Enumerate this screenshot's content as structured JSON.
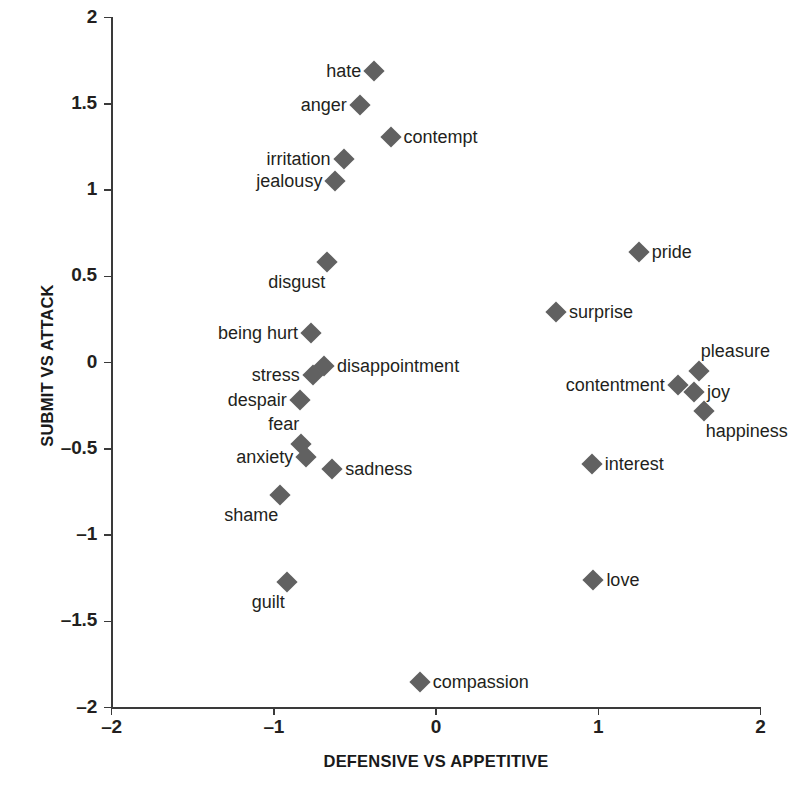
{
  "chart_data": {
    "type": "scatter",
    "title": "",
    "xlabel": "DEFENSIVE VS APPETITIVE",
    "ylabel": "SUBMIT VS ATTACK",
    "xlim": [
      -2,
      2
    ],
    "ylim": [
      -2,
      2
    ],
    "xticks": [
      "-2",
      "-1",
      "0",
      "1",
      "2"
    ],
    "xtick_values": [
      -2,
      -1,
      0,
      1,
      2
    ],
    "yticks": [
      "2",
      "1.5",
      "1",
      "0.5",
      "0",
      "-0.5",
      "-1",
      "-1.5",
      "-2"
    ],
    "ytick_values": [
      2,
      1.5,
      1,
      0.5,
      0,
      -0.5,
      -1,
      -1.5,
      -2
    ],
    "grid": false,
    "legend": null,
    "marker": "diamond",
    "marker_color": "#616161",
    "axis_color": "#3a3a3a",
    "points": [
      {
        "label": "hate",
        "x": -0.38,
        "y": 1.69,
        "label_pos": "lbl-left"
      },
      {
        "label": "anger",
        "x": -0.47,
        "y": 1.49,
        "label_pos": "lbl-left"
      },
      {
        "label": "contempt",
        "x": -0.28,
        "y": 1.31,
        "label_pos": "lbl-right"
      },
      {
        "label": "irritation",
        "x": -0.57,
        "y": 1.18,
        "label_pos": "lbl-left"
      },
      {
        "label": "jealousy",
        "x": -0.62,
        "y": 1.05,
        "label_pos": "lbl-left"
      },
      {
        "label": "disgust",
        "x": -0.67,
        "y": 0.58,
        "label_pos": "lbl-below-left"
      },
      {
        "label": "being hurt",
        "x": -0.77,
        "y": 0.17,
        "label_pos": "lbl-left"
      },
      {
        "label": "disappointment",
        "x": -0.69,
        "y": -0.02,
        "label_pos": "lbl-right"
      },
      {
        "label": "stress",
        "x": -0.76,
        "y": -0.07,
        "label_pos": "lbl-left"
      },
      {
        "label": "despair",
        "x": -0.84,
        "y": -0.22,
        "label_pos": "lbl-left"
      },
      {
        "label": "fear",
        "x": -0.83,
        "y": -0.47,
        "label_pos": "lbl-above-left"
      },
      {
        "label": "anxiety",
        "x": -0.8,
        "y": -0.55,
        "label_pos": "lbl-left"
      },
      {
        "label": "sadness",
        "x": -0.64,
        "y": -0.62,
        "label_pos": "lbl-right"
      },
      {
        "label": "shame",
        "x": -0.96,
        "y": -0.77,
        "label_pos": "lbl-below-left"
      },
      {
        "label": "guilt",
        "x": -0.92,
        "y": -1.27,
        "label_pos": "lbl-below-left"
      },
      {
        "label": "compassion",
        "x": -0.1,
        "y": -1.85,
        "label_pos": "lbl-right"
      },
      {
        "label": "pride",
        "x": 1.25,
        "y": 0.64,
        "label_pos": "lbl-right"
      },
      {
        "label": "surprise",
        "x": 0.74,
        "y": 0.29,
        "label_pos": "lbl-right"
      },
      {
        "label": "pleasure",
        "x": 1.62,
        "y": -0.05,
        "label_pos": "lbl-above-right"
      },
      {
        "label": "contentment",
        "x": 1.49,
        "y": -0.13,
        "label_pos": "lbl-left"
      },
      {
        "label": "joy",
        "x": 1.59,
        "y": -0.17,
        "label_pos": "lbl-right"
      },
      {
        "label": "happiness",
        "x": 1.65,
        "y": -0.28,
        "label_pos": "lbl-below-right"
      },
      {
        "label": "interest",
        "x": 0.96,
        "y": -0.59,
        "label_pos": "lbl-right"
      },
      {
        "label": "love",
        "x": 0.97,
        "y": -1.26,
        "label_pos": "lbl-right"
      }
    ]
  }
}
